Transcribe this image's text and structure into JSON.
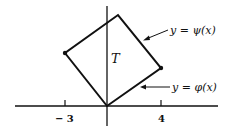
{
  "diagram": {
    "region_label": "T",
    "upper_curve_label": "y = ψ(x)",
    "lower_curve_label": "y = φ(x)",
    "x_ticks": [
      {
        "label": "− 3",
        "value": -3
      },
      {
        "label": "4",
        "value": 4
      }
    ],
    "vertices": {
      "origin": [
        0,
        0
      ],
      "left": [
        -3,
        "a"
      ],
      "top": [
        "b",
        "c"
      ],
      "right": [
        4,
        "d"
      ]
    },
    "colors": {
      "line": "#111111",
      "background": "#ffffff"
    }
  }
}
